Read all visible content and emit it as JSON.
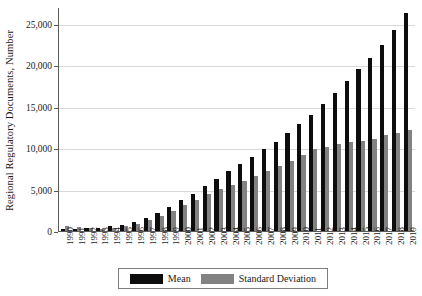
{
  "chart_data": {
    "type": "bar",
    "title": "",
    "xlabel": "",
    "ylabel": "Regional Regulatory Documents, Number",
    "ylim": [
      0,
      27000
    ],
    "yticks": [
      0,
      5000,
      10000,
      15000,
      20000,
      25000
    ],
    "ytick_labels": [
      "0",
      "5,000",
      "10,000",
      "15,000",
      "20,000",
      "25,000"
    ],
    "grid": true,
    "legend_position": "bottom",
    "categories": [
      "1990",
      "1991",
      "1992",
      "1993",
      "1994",
      "1995",
      "1996",
      "1997",
      "1998",
      "1999",
      "2000",
      "2001",
      "2002",
      "2003",
      "2004",
      "2005",
      "2006",
      "2007",
      "2008",
      "2009",
      "2010",
      "2011",
      "2012",
      "2013",
      "2014",
      "2015",
      "2016",
      "2017",
      "2018",
      "2019"
    ],
    "series": [
      {
        "name": "Mean",
        "color": "#0d0d0d",
        "values": [
          350,
          400,
          430,
          520,
          700,
          900,
          1250,
          1700,
          2350,
          3000,
          3800,
          4600,
          5500,
          6400,
          7300,
          8200,
          9100,
          10000,
          10900,
          11900,
          13000,
          14100,
          15400,
          16800,
          18200,
          19600,
          21000,
          22500,
          24300,
          26400
        ]
      },
      {
        "name": "Standard Deviation",
        "color": "#828282",
        "values": [
          700,
          650,
          500,
          420,
          480,
          700,
          1000,
          1400,
          1900,
          2500,
          3200,
          3900,
          4600,
          5200,
          5700,
          6200,
          6700,
          7300,
          7900,
          8600,
          9300,
          10000,
          10300,
          10600,
          10900,
          11000,
          11200,
          11700,
          11900,
          12300
        ]
      }
    ]
  },
  "legend": {
    "items": [
      {
        "label": "Mean",
        "color": "#0d0d0d"
      },
      {
        "label": "Standard Deviation",
        "color": "#828282"
      }
    ]
  }
}
